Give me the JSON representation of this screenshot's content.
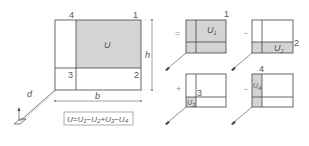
{
  "colors": {
    "line": "#444444",
    "shade": "#d4d4d4",
    "text": "#555555",
    "background": "#ffffff"
  },
  "main": {
    "area_label": "U",
    "corners": {
      "c1": "1",
      "c2": "2",
      "c3": "3",
      "c4": "4"
    },
    "dimensions": {
      "height": "h",
      "width": "b",
      "distance": "d"
    },
    "formula": {
      "lhs": "U",
      "eq": "=",
      "t1": "U",
      "t1_sub": "1",
      "op1": "−",
      "t2": "U",
      "t2_sub": "2",
      "op2": "+",
      "t3": "U",
      "t3_sub": "3",
      "op3": "−",
      "t4": "U",
      "t4_sub": "4"
    }
  },
  "decomposition": {
    "operators": {
      "first": "=",
      "second": "−",
      "third": "+",
      "fourth": "−"
    },
    "panels": [
      {
        "corner": "1",
        "area": "U",
        "sub": "1"
      },
      {
        "corner": "2",
        "area": "U",
        "sub": "2"
      },
      {
        "corner": "3",
        "area": "U",
        "sub": "3"
      },
      {
        "corner": "4",
        "area": "U",
        "sub": "4"
      }
    ]
  }
}
